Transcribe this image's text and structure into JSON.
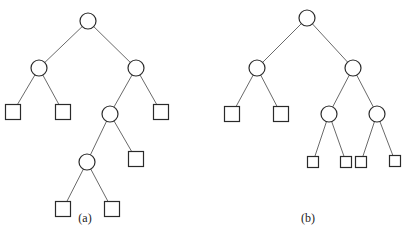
{
  "diagram": {
    "type": "binary-trees",
    "colors": {
      "stroke": "#2a2a2a",
      "edge": "#6a6a6a",
      "background": "#ffffff"
    },
    "trees": [
      {
        "id": "a",
        "caption": "(a)",
        "caption_pos": [
          85,
          222
        ],
        "internal_radius": 8,
        "leaf_size": 15,
        "nodes": [
          {
            "id": "r",
            "kind": "internal",
            "x": 88,
            "y": 21
          },
          {
            "id": "l",
            "kind": "internal",
            "x": 39,
            "y": 68
          },
          {
            "id": "rt",
            "kind": "internal",
            "x": 136,
            "y": 68
          },
          {
            "id": "ll",
            "kind": "leaf",
            "x": 13,
            "y": 112
          },
          {
            "id": "lr",
            "kind": "leaf",
            "x": 63,
            "y": 112
          },
          {
            "id": "rl",
            "kind": "internal",
            "x": 110,
            "y": 114
          },
          {
            "id": "rr",
            "kind": "leaf",
            "x": 161,
            "y": 112
          },
          {
            "id": "rll",
            "kind": "internal",
            "x": 87,
            "y": 162
          },
          {
            "id": "rlr",
            "kind": "leaf",
            "x": 136,
            "y": 159
          },
          {
            "id": "rlll",
            "kind": "leaf",
            "x": 63,
            "y": 209
          },
          {
            "id": "rllr",
            "kind": "leaf",
            "x": 112,
            "y": 209
          }
        ],
        "edges": [
          [
            "r",
            "l"
          ],
          [
            "r",
            "rt"
          ],
          [
            "l",
            "ll"
          ],
          [
            "l",
            "lr"
          ],
          [
            "rt",
            "rl"
          ],
          [
            "rt",
            "rr"
          ],
          [
            "rl",
            "rll"
          ],
          [
            "rl",
            "rlr"
          ],
          [
            "rll",
            "rlll"
          ],
          [
            "rll",
            "rllr"
          ]
        ]
      },
      {
        "id": "b",
        "caption": "(b)",
        "caption_pos": [
          308,
          222
        ],
        "internal_radius": 8,
        "leaf_size": 15,
        "small_leaf_size": 11,
        "nodes": [
          {
            "id": "r",
            "kind": "internal",
            "x": 307,
            "y": 18
          },
          {
            "id": "l",
            "kind": "internal",
            "x": 257,
            "y": 68
          },
          {
            "id": "rt",
            "kind": "internal",
            "x": 353,
            "y": 68
          },
          {
            "id": "ll",
            "kind": "leaf",
            "x": 232,
            "y": 114
          },
          {
            "id": "lr",
            "kind": "leaf",
            "x": 281,
            "y": 114
          },
          {
            "id": "rl",
            "kind": "internal",
            "x": 329,
            "y": 114
          },
          {
            "id": "rr",
            "kind": "internal",
            "x": 377,
            "y": 114
          },
          {
            "id": "rll",
            "kind": "small-leaf",
            "x": 313,
            "y": 162
          },
          {
            "id": "rlr",
            "kind": "small-leaf",
            "x": 346,
            "y": 162
          },
          {
            "id": "rrl",
            "kind": "small-leaf",
            "x": 361,
            "y": 162
          },
          {
            "id": "rrr",
            "kind": "small-leaf",
            "x": 395,
            "y": 161
          }
        ],
        "edges": [
          [
            "r",
            "l"
          ],
          [
            "r",
            "rt"
          ],
          [
            "l",
            "ll"
          ],
          [
            "l",
            "lr"
          ],
          [
            "rt",
            "rl"
          ],
          [
            "rt",
            "rr"
          ],
          [
            "rl",
            "rll"
          ],
          [
            "rl",
            "rlr"
          ],
          [
            "rr",
            "rrl"
          ],
          [
            "rr",
            "rrr"
          ]
        ]
      }
    ]
  }
}
